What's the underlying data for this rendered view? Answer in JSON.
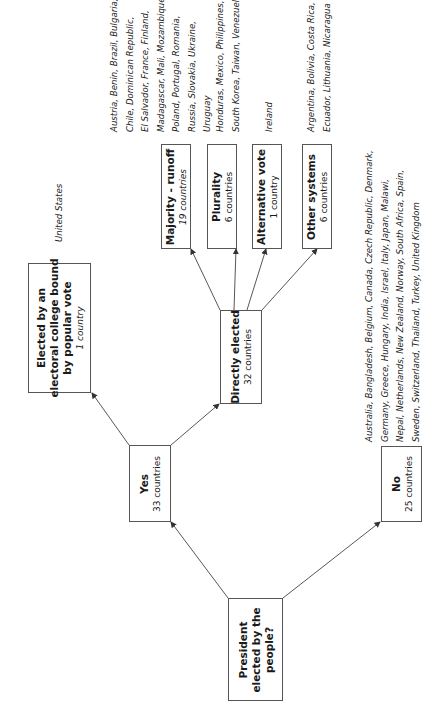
{
  "diagram": {
    "root": {
      "title_lines": [
        "President",
        "elected by the",
        "people?"
      ]
    },
    "yes": {
      "title": "Yes",
      "count": "33 countries"
    },
    "no": {
      "title": "No",
      "count": "25 countries",
      "countries_lines": [
        "Australia, Bangladesh, Belgium, Canada, Czech Republic, Denmark,",
        "Germany, Greece, Hungary, India, Israel, Italy, Japan, Malawi,",
        "Nepal, Netherlands, New Zealand, Norway, South Africa, Spain,",
        "Sweden, Switzerland, Thailand, Turkey, United Kingdom"
      ]
    },
    "electoral_college": {
      "title_lines": [
        "Elected by an",
        "electoral college bound",
        "by popular vote"
      ],
      "count": "1 country",
      "countries_lines": [
        "United States"
      ]
    },
    "directly_elected": {
      "title": "Directly elected",
      "count": "32 countries"
    },
    "majority_runoff": {
      "title": "Majority - runoff",
      "count": "19 countries",
      "countries_lines": [
        "Austria, Benin, Brazil, Bulgaria,",
        "Chile, Dominican Republic,",
        "El Salvador, France, Finland,",
        "Madagascar, Mali, Mozambique,",
        "Poland, Portugal, Romania,",
        "Russia, Slovakia, Ukraine,",
        "Uruguay"
      ]
    },
    "plurality": {
      "title": "Plurality",
      "count": "6 countries",
      "countries_lines": [
        "Honduras, Mexico, Philippines,",
        "South Korea, Taiwan, Venezuela"
      ]
    },
    "alternative_vote": {
      "title": "Alternative vote",
      "count": "1 country",
      "countries_lines": [
        "Ireland"
      ]
    },
    "other_systems": {
      "title": "Other systems",
      "count": "6 countries",
      "countries_lines": [
        "Argentina, Bolivia, Costa Rica,",
        "Ecuador, Lithuania, Nicaragua"
      ]
    }
  },
  "colors": {
    "line": "#444444",
    "border": "#555555",
    "text": "#1a1a1a"
  }
}
